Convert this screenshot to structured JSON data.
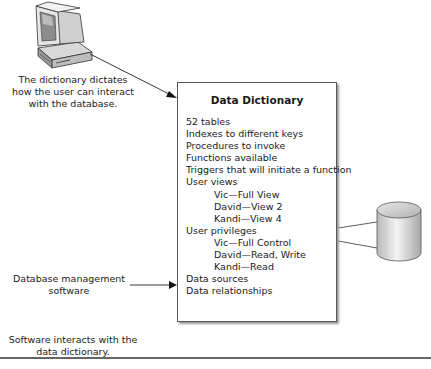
{
  "user_caption": [
    "The dictionary dictates",
    "how the user can interact",
    "with the database."
  ],
  "dbms_label": [
    "Database management",
    "software"
  ],
  "bottom_caption": [
    "Software interacts with the",
    "data dictionary."
  ],
  "dictionary": {
    "title": "Data Dictionary",
    "items": [
      {
        "text": "52 tables",
        "indent": false
      },
      {
        "text": "Indexes to different keys",
        "indent": false
      },
      {
        "text": "Procedures to invoke",
        "indent": false
      },
      {
        "text": "Functions available",
        "indent": false
      },
      {
        "text": "Triggers that will initiate a function",
        "indent": false
      },
      {
        "text": "User views",
        "indent": false
      },
      {
        "text": "Vic—Full View",
        "indent": true
      },
      {
        "text": "David—View 2",
        "indent": true
      },
      {
        "text": "Kandi—View 4",
        "indent": true
      },
      {
        "text": "User privileges",
        "indent": false
      },
      {
        "text": "Vic—Full Control",
        "indent": true
      },
      {
        "text": "David—Read, Write",
        "indent": true
      },
      {
        "text": "Kandi—Read",
        "indent": true
      },
      {
        "text": "Data sources",
        "indent": false
      },
      {
        "text": "Data relationships",
        "indent": false
      }
    ]
  },
  "icons": {
    "computer": "computer-icon",
    "database": "database-cylinder-icon"
  }
}
